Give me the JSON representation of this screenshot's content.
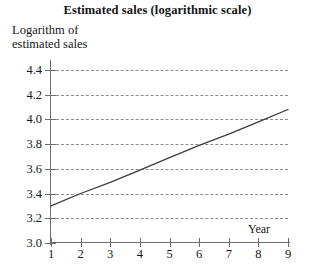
{
  "chart_data": {
    "type": "line",
    "title": "Estimated sales (logarithmic scale)",
    "xlabel": "Year",
    "ylabel": "Logarithm of\nestimated sales",
    "x": [
      1,
      2,
      3,
      4,
      5,
      6,
      7,
      8,
      9
    ],
    "series": [
      {
        "name": "Logarithm of estimated sales",
        "values": [
          3.3,
          3.4,
          3.49,
          3.59,
          3.69,
          3.79,
          3.88,
          3.98,
          4.08
        ]
      }
    ],
    "xlim": [
      1,
      9
    ],
    "ylim": [
      3.0,
      4.4
    ],
    "x_ticks": [
      "1",
      "2",
      "3",
      "4",
      "5",
      "6",
      "7",
      "8",
      "9"
    ],
    "y_ticks": [
      "3.0",
      "3.2",
      "3.4",
      "3.6",
      "3.8",
      "4.0",
      "4.2",
      "4.4"
    ],
    "grid": "horizontal-dashed",
    "legend": "none",
    "line_color": "#3c3c3c",
    "grid_color": "#8c8c8c",
    "axis_color": "#6e6e6e"
  }
}
